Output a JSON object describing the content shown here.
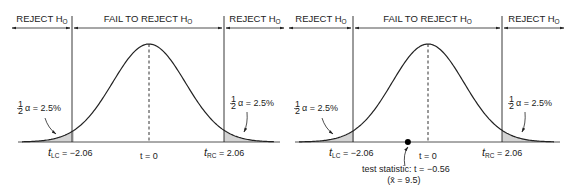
{
  "colors": {
    "line": "#222222",
    "shade": "#d4d4d4",
    "axis": "#555555"
  },
  "panels": [
    {
      "id": "left",
      "regions": {
        "reject_left": {
          "text": "REJECT H",
          "sub": "O"
        },
        "fail": {
          "text": "FAIL TO REJECT H",
          "sub": "O"
        },
        "reject_right": {
          "text": "REJECT H",
          "sub": "O"
        }
      },
      "alpha_left": {
        "frac_num": "1",
        "frac_den": "2",
        "text": "α = 2.5%"
      },
      "alpha_right": {
        "frac_num": "1",
        "frac_den": "2",
        "text": "α = 2.5%"
      },
      "tlc": {
        "t": "t",
        "sub": "LC",
        "value": " = −2.06"
      },
      "trc": {
        "t": "t",
        "sub": "RC",
        "value": " = 2.06"
      },
      "center": "t = 0",
      "critical_values": [
        -2.06,
        2.06
      ]
    },
    {
      "id": "right",
      "regions": {
        "reject_left": {
          "text": "REJECT H",
          "sub": "O"
        },
        "fail": {
          "text": "FAIL TO REJECT H",
          "sub": "O"
        },
        "reject_right": {
          "text": "REJECT H",
          "sub": "O"
        }
      },
      "alpha_left": {
        "frac_num": "1",
        "frac_den": "2",
        "text": "α = 2.5%"
      },
      "alpha_right": {
        "frac_num": "1",
        "frac_den": "2",
        "text": "α = 2.5%"
      },
      "tlc": {
        "t": "t",
        "sub": "LC",
        "value": " = −2.06"
      },
      "trc": {
        "t": "t",
        "sub": "RC",
        "value": " = 2.06"
      },
      "center": "t = 0",
      "critical_values": [
        -2.06,
        2.06
      ],
      "test_statistic": {
        "label": "test statistic: t = −0.56",
        "xbar_label": "(x̄ = 9.5)",
        "value": -0.56
      }
    }
  ]
}
